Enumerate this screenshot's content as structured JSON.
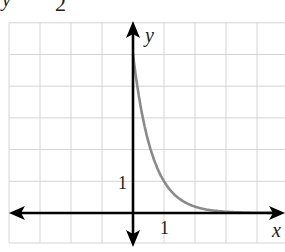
{
  "title_fragment": {
    "left_glyph": "y",
    "right_glyph": "2"
  },
  "colors": {
    "grid": "#d4d4d4",
    "axis": "#000000",
    "curve": "#8a8a8a",
    "text": "#222222"
  },
  "chart_data": {
    "type": "line",
    "xlabel": "x",
    "ylabel": "y",
    "x_tick_labels": [
      "1"
    ],
    "y_tick_labels": [
      "1"
    ],
    "xlim": [
      -4,
      5
    ],
    "ylim": [
      -1,
      6
    ],
    "grid": true,
    "legend": null,
    "series": [
      {
        "name": "exponential decay curve",
        "x": [
          0,
          0.25,
          0.5,
          0.75,
          1,
          1.5,
          2,
          2.5,
          3,
          3.5,
          4,
          4.5
        ],
        "y": [
          5,
          3.34,
          2.24,
          1.5,
          1.0,
          0.45,
          0.2,
          0.09,
          0.04,
          0.02,
          0.01,
          0.0
        ]
      }
    ],
    "annotations": [
      {
        "text": "1",
        "position": "y-axis tick at y=1"
      },
      {
        "text": "1",
        "position": "x-axis tick at x=1"
      }
    ]
  }
}
